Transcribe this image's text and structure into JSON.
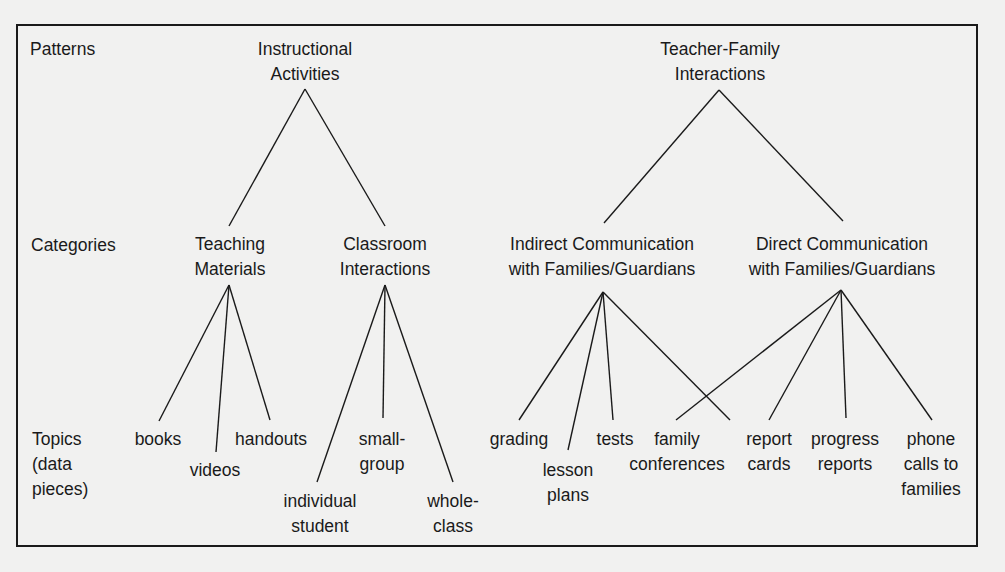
{
  "row_labels": {
    "patterns": "Patterns",
    "categories": "Categories",
    "topics": "Topics\n(data\npieces)"
  },
  "patterns": [
    {
      "label": "Instructional\nActivities"
    },
    {
      "label": "Teacher-Family\nInteractions"
    }
  ],
  "categories": [
    {
      "label": "Teaching\nMaterials",
      "pattern": "Instructional Activities"
    },
    {
      "label": "Classroom\nInteractions",
      "pattern": "Instructional Activities"
    },
    {
      "label": "Indirect Communication\nwith Families/Guardians",
      "pattern": "Teacher-Family Interactions"
    },
    {
      "label": "Direct Communication\nwith Families/Guardians",
      "pattern": "Teacher-Family Interactions"
    }
  ],
  "topics": [
    {
      "label": "books",
      "categories": [
        "Teaching Materials"
      ]
    },
    {
      "label": "videos",
      "categories": [
        "Teaching Materials"
      ]
    },
    {
      "label": "handouts",
      "categories": [
        "Teaching Materials"
      ]
    },
    {
      "label": "individual\nstudent",
      "categories": [
        "Classroom Interactions"
      ]
    },
    {
      "label": "small-\ngroup",
      "categories": [
        "Classroom Interactions"
      ]
    },
    {
      "label": "whole-\nclass",
      "categories": [
        "Classroom Interactions"
      ]
    },
    {
      "label": "grading",
      "categories": [
        "Indirect Communication with Families/Guardians"
      ]
    },
    {
      "label": "lesson\nplans",
      "categories": [
        "Indirect Communication with Families/Guardians"
      ]
    },
    {
      "label": "tests",
      "categories": [
        "Indirect Communication with Families/Guardians"
      ]
    },
    {
      "label": "family\nconferences",
      "categories": [
        "Direct Communication with Families/Guardians"
      ]
    },
    {
      "label": "report\ncards",
      "categories": [
        "Indirect Communication with Families/Guardians",
        "Direct Communication with Families/Guardians"
      ]
    },
    {
      "label": "progress\nreports",
      "categories": [
        "Direct Communication with Families/Guardians"
      ]
    },
    {
      "label": "phone\ncalls to\nfamilies",
      "categories": [
        "Direct Communication with Families/Guardians"
      ]
    }
  ]
}
